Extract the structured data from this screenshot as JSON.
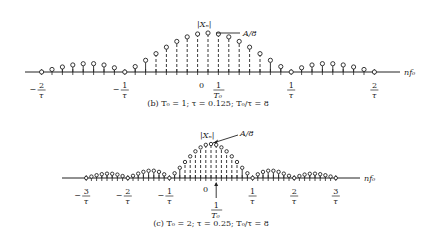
{
  "figures": [
    {
      "id": "b",
      "caption": "(b)  T₀ = 1; τ = 0.125; T₀/τ = 8",
      "y_label": "|Xₙ|",
      "peak_label": "A/8",
      "x_axis_label": "nf₀",
      "tick_labels": [
        {
          "num": "2",
          "den": "τ",
          "sign": "−",
          "k": -2
        },
        {
          "num": "1",
          "den": "τ",
          "sign": "−",
          "k": -1
        },
        {
          "num": "1",
          "den": "τ",
          "sign": "",
          "k": 1
        },
        {
          "num": "2",
          "den": "τ",
          "sign": "",
          "k": 2
        }
      ],
      "origin_label": "0",
      "f0_label": {
        "num": "1",
        "den": "T₀"
      }
    },
    {
      "id": "c",
      "caption": "(c)  T₀ = 2; τ = 0.25; T₀/τ = 8",
      "y_label": "|Xₙ|",
      "peak_label": "A/8",
      "x_axis_label": "nf₀",
      "tick_labels": [
        {
          "num": "3",
          "den": "τ",
          "sign": "−",
          "k": -3
        },
        {
          "num": "2",
          "den": "τ",
          "sign": "−",
          "k": -2
        },
        {
          "num": "1",
          "den": "τ",
          "sign": "−",
          "k": -1
        },
        {
          "num": "1",
          "den": "τ",
          "sign": "",
          "k": 1
        },
        {
          "num": "2",
          "den": "τ",
          "sign": "",
          "k": 2
        },
        {
          "num": "3",
          "den": "τ",
          "sign": "",
          "k": 3
        }
      ],
      "origin_label": "0",
      "f0_label": {
        "num": "1",
        "den": "T₀"
      }
    }
  ],
  "chart_data": [
    {
      "type": "stem",
      "title": "(b) T0 = 1; tau = 0.125; T0/tau = 8",
      "xlabel": "nf0",
      "ylabel": "|Xn|",
      "x_unit": "harmonic index n (f = n/T0)",
      "n_range": [
        -16,
        16
      ],
      "formula": "|Xn| = (A/8)|sinc(n/8)|",
      "peak_value": "A/8",
      "zeros_at": [
        "-2/tau",
        "-1/tau",
        "1/tau",
        "2/tau"
      ],
      "x_ticks": [
        "-2/tau",
        "-1/tau",
        "0",
        "1/T0",
        "1/tau",
        "2/tau"
      ],
      "max_height_px": 39,
      "spacing_px": 10.4
    },
    {
      "type": "stem",
      "title": "(c) T0 = 2; tau = 0.25; T0/tau = 8",
      "xlabel": "nf0",
      "ylabel": "|Xn|",
      "x_unit": "harmonic index n (f = n/T0)",
      "n_range": [
        -24,
        24
      ],
      "formula": "|Xn| = (A/8)|sinc(n/8)|",
      "peak_value": "A/8",
      "zeros_at": [
        "-3/tau",
        "-2/tau",
        "-1/tau",
        "1/tau",
        "2/tau",
        "3/tau"
      ],
      "x_ticks": [
        "-3/tau",
        "-2/tau",
        "-1/tau",
        "0",
        "1/T0",
        "1/tau",
        "2/tau",
        "3/tau"
      ],
      "max_height_px": 34,
      "spacing_px": 5.2
    }
  ],
  "layout": {
    "b": {
      "x0": 208,
      "axis_y": 72,
      "dx": 10.4,
      "hmax": 39,
      "nmin": -16,
      "nmax": 16,
      "axis_from": 25,
      "axis_to": 400,
      "nf0_x": 404,
      "lbl_y": 88,
      "cap_y": 106
    },
    "c": {
      "x0": 211,
      "axis_y": 178,
      "dx": 5.2,
      "hmax": 34,
      "nmin": -24,
      "nmax": 24,
      "axis_from": 62,
      "axis_to": 360,
      "nf0_x": 364,
      "lbl_y": 194,
      "cap_y": 226
    }
  }
}
